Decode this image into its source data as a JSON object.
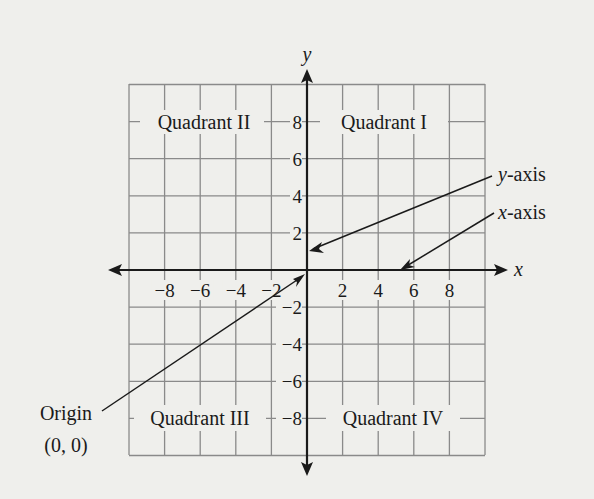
{
  "axes": {
    "x_label": "x",
    "y_label": "y"
  },
  "x_ticks": [
    {
      "v": -8,
      "t": "−8"
    },
    {
      "v": -6,
      "t": "−6"
    },
    {
      "v": -4,
      "t": "−4"
    },
    {
      "v": -2,
      "t": "−2"
    },
    {
      "v": 2,
      "t": "2"
    },
    {
      "v": 4,
      "t": "4"
    },
    {
      "v": 6,
      "t": "6"
    },
    {
      "v": 8,
      "t": "8"
    }
  ],
  "y_ticks": [
    {
      "v": 8,
      "t": "8"
    },
    {
      "v": 6,
      "t": "6"
    },
    {
      "v": 4,
      "t": "4"
    },
    {
      "v": 2,
      "t": "2"
    },
    {
      "v": -2,
      "t": "−2"
    },
    {
      "v": -4,
      "t": "−4"
    },
    {
      "v": -6,
      "t": "−6"
    },
    {
      "v": -8,
      "t": "−8"
    }
  ],
  "quadrants": {
    "q1": "Quadrant I",
    "q2": "Quadrant II",
    "q3": "Quadrant III",
    "q4": "Quadrant IV"
  },
  "callouts": {
    "y_axis": "-axis",
    "y_axis_var": "y",
    "x_axis": "-axis",
    "x_axis_var": "x",
    "origin": "Origin",
    "origin_coords": "(0, 0)"
  },
  "colors": {
    "grid": "#8a8a8a",
    "axis": "#1a1a1a",
    "background": "#efefec"
  }
}
